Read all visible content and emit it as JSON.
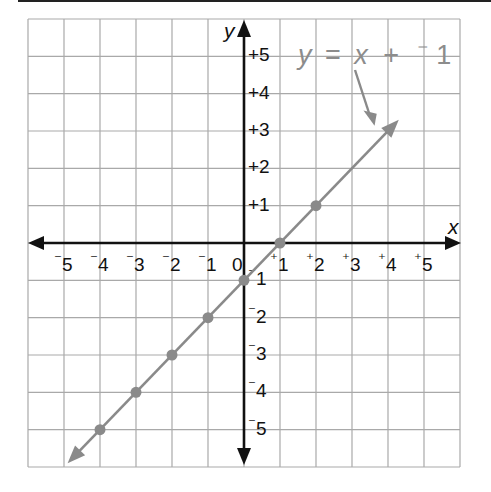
{
  "chart_data": {
    "type": "line",
    "title": "",
    "xlabel": "x",
    "ylabel": "y",
    "xlim": [
      -6,
      6
    ],
    "ylim": [
      -6,
      6
    ],
    "grid": true,
    "x_ticks": [
      -5,
      -4,
      -3,
      -2,
      -1,
      0,
      1,
      2,
      3,
      4,
      5
    ],
    "x_tick_labels": [
      "⁻5",
      "⁻4",
      "⁻3",
      "⁻2",
      "⁻1",
      "0",
      "⁺1",
      "⁺2",
      "⁺3",
      "⁺4",
      "⁺5"
    ],
    "y_ticks": [
      5,
      4,
      3,
      2,
      1,
      -1,
      -2,
      -3,
      -4,
      -5
    ],
    "y_tick_labels": [
      "⁺5",
      "⁺4",
      "⁺3",
      "⁺2",
      "⁺1",
      "⁻1",
      "⁻2",
      "⁻3",
      "⁻4",
      "⁻5"
    ],
    "series": [
      {
        "name": "y = x + ⁻1",
        "equation": "y = x - 1",
        "color": "#8a8a8a",
        "points": [
          {
            "x": -4,
            "y": -5
          },
          {
            "x": -3,
            "y": -4
          },
          {
            "x": -2,
            "y": -3
          },
          {
            "x": -1,
            "y": -2
          },
          {
            "x": 0,
            "y": -1
          },
          {
            "x": 1,
            "y": 0
          },
          {
            "x": 2,
            "y": 1
          }
        ],
        "line_extent": {
          "from": {
            "x": -4.9,
            "y": -5.9
          },
          "to": {
            "x": 4.3,
            "y": 3.3
          }
        },
        "arrows_both_ends": true
      }
    ],
    "annotations": [
      {
        "text": "y = x + ⁻1",
        "points_to": "line near (3.6, 3.3)"
      }
    ]
  },
  "labels": {
    "x_axis": "x",
    "y_axis": "y",
    "equation": {
      "y": "y",
      "eq": "=",
      "x": "x",
      "plus": "+",
      "neg": "⁻",
      "one": "1"
    }
  }
}
